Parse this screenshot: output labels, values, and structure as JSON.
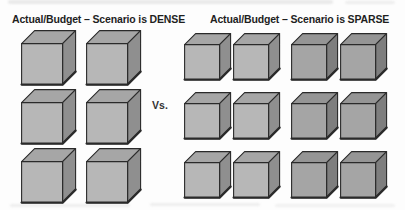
{
  "figure": {
    "description_left": "dense cube grid",
    "description_right": "sparse cube grid"
  },
  "vs_label": "Vs.",
  "dense_group": {
    "title": "Actual/Budget – Scenario is DENSE",
    "columns": 2,
    "rows": 3,
    "cube_count": 6,
    "column_shades": [
      "light",
      "light"
    ]
  },
  "sparse_group": {
    "title": "Actual/Budget – Scenario is SPARSE",
    "columns": 4,
    "rows": 3,
    "cube_count": 12,
    "column_shades": [
      "light",
      "light",
      "dark",
      "dark"
    ]
  },
  "colors": {
    "background": "#fdfdfd",
    "outline": "#2a2a2a",
    "title_text": "#1f1f1f",
    "vs_text": "#333333",
    "cube_light": {
      "top": "#a6a6a6",
      "front": "#b7b7b7",
      "side": "#8f8f8f"
    },
    "cube_dark": {
      "top": "#959595",
      "front": "#a5a5a5",
      "side": "#7e7e7e"
    }
  }
}
